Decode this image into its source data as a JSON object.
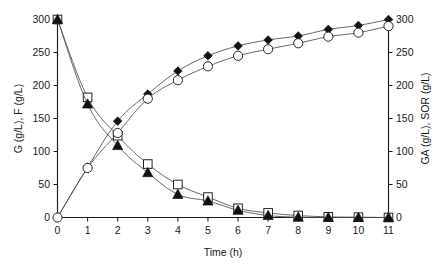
{
  "chart_data": {
    "type": "line",
    "title": "",
    "xlabel": "Time (h)",
    "ylabel": "G (g/L), F (g/L)",
    "y2label": "GA (g/L), SOR (g/L)",
    "x": [
      0,
      1,
      2,
      3,
      4,
      5,
      6,
      7,
      8,
      9,
      10,
      11
    ],
    "xlim": [
      0,
      11
    ],
    "ylim": [
      0,
      300
    ],
    "y2lim": [
      0,
      300
    ],
    "xticks": [
      "0",
      "1",
      "2",
      "3",
      "4",
      "5",
      "6",
      "7",
      "8",
      "9",
      "10",
      "11"
    ],
    "yticks": [
      "0",
      "50",
      "100",
      "150",
      "200",
      "250",
      "300"
    ],
    "y2ticks": [
      "0",
      "50",
      "100",
      "150",
      "200",
      "250",
      "300"
    ],
    "grid": false,
    "legend": "none",
    "series": [
      {
        "name": "G (g/L)",
        "axis": "left",
        "marker": "open-square",
        "values": [
          300,
          182,
          124,
          81,
          50,
          31,
          14,
          7,
          3,
          1,
          0.5,
          0
        ]
      },
      {
        "name": "F (g/L)",
        "axis": "left",
        "marker": "filled-triangle",
        "values": [
          300,
          172,
          109,
          68,
          35,
          25,
          11,
          3,
          0.5,
          0,
          0,
          0
        ]
      },
      {
        "name": "GA (g/L)",
        "axis": "right",
        "marker": "filled-diamond",
        "values": [
          0,
          76,
          146,
          187,
          222,
          245,
          260,
          269,
          275,
          285,
          291,
          300
        ]
      },
      {
        "name": "SOR (g/L)",
        "axis": "right",
        "marker": "open-circle",
        "values": [
          0,
          75,
          128,
          180,
          208,
          229,
          245,
          255,
          264,
          274,
          280,
          290
        ]
      }
    ]
  }
}
